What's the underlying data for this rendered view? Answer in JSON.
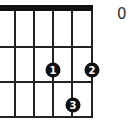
{
  "diagram": {
    "type": "guitar-chord-diagram",
    "label": "0 9",
    "strings_x": [
      15,
      34,
      53,
      72,
      91
    ],
    "frets_y": [
      47,
      82,
      117
    ],
    "nut": {
      "x": 0,
      "y": 5,
      "width": 93,
      "height": 6
    },
    "fingers": [
      {
        "finger": "1",
        "x": 53,
        "y": 70
      },
      {
        "finger": "2",
        "x": 92,
        "y": 70
      },
      {
        "finger": "3",
        "x": 73,
        "y": 105
      }
    ]
  }
}
